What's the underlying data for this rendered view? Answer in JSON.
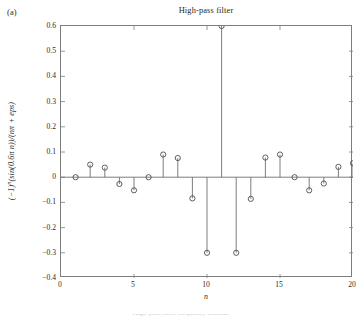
{
  "panel": {
    "label": "(a)"
  },
  "axis_label_x": "n",
  "axis_label_y_prefix": "(−1)",
  "axis_label_y_exp": "n",
  "axis_label_y_rest": "(sin(0.6π n))/(nπ + eps)",
  "caption": "High-pass filter frequency domain",
  "colors": {
    "axis": "#7d7d7d",
    "stem": "#6f6f6f",
    "marker_edge": "#4d4d4d",
    "text": "#231f20",
    "background": "#ffffff"
  },
  "chart_data": {
    "type": "line",
    "plot_style": "stem",
    "title": "High-pass filter",
    "xlabel": "n",
    "ylabel": "(−1)^n(sin(0.6π n))/(nπ + eps)",
    "xlim": [
      0,
      20
    ],
    "ylim": [
      -0.4,
      0.6
    ],
    "xticks": [
      0,
      5,
      10,
      15,
      20
    ],
    "yticks": [
      -0.4,
      -0.3,
      -0.2,
      -0.1,
      0,
      0.1,
      0.2,
      0.3,
      0.4,
      0.5,
      0.6
    ],
    "xticklabels": [
      "0",
      "5",
      "10",
      "15",
      "20"
    ],
    "yticklabels": [
      "−0.4",
      "−0.3",
      "−0.2",
      "−0.1",
      "0",
      "0.1",
      "0.2",
      "0.3",
      "0.4",
      "0.5",
      "0.6"
    ],
    "grid": false,
    "legend": false,
    "marker": "circle-open",
    "x": [
      1,
      2,
      3,
      4,
      5,
      6,
      7,
      8,
      9,
      10,
      11,
      12,
      13,
      14,
      15,
      16,
      17,
      18,
      19,
      20
    ],
    "values": [
      0.0,
      0.05,
      0.038,
      -0.027,
      -0.052,
      0.0,
      0.09,
      0.076,
      -0.084,
      -0.3,
      0.6,
      -0.3,
      -0.086,
      0.078,
      0.09,
      0.0,
      -0.052,
      -0.025,
      0.041,
      0.055
    ],
    "peak": {
      "x": 11,
      "y": 0.6
    },
    "minima": [
      {
        "x": 10,
        "y": -0.3
      },
      {
        "x": 12,
        "y": -0.3
      }
    ]
  }
}
